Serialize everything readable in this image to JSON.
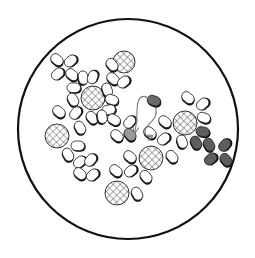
{
  "diagram": {
    "colors": {
      "background": "#ffffff",
      "outline": "#111111",
      "cell_fill": "#ffffff",
      "cell_shadow": "#111111",
      "donor_fill": "#6a6a6a",
      "recipient_fill": "#9a9a9a",
      "transformed_fill": "#5e5e5e",
      "hatch": "#444444",
      "arrow": "#777777"
    },
    "boundary": {
      "cx": 128,
      "cy": 129,
      "r": 110
    },
    "spheres": [
      {
        "x": 124,
        "y": 62,
        "r": 11
      },
      {
        "x": 93,
        "y": 98,
        "r": 12
      },
      {
        "x": 57,
        "y": 136,
        "r": 12
      },
      {
        "x": 185,
        "y": 123,
        "r": 12
      },
      {
        "x": 151,
        "y": 158,
        "r": 12
      },
      {
        "x": 117,
        "y": 193,
        "r": 12
      }
    ],
    "cells": [
      {
        "x": 57,
        "y": 60,
        "a": 40,
        "t": "plain"
      },
      {
        "x": 71,
        "y": 61,
        "a": -40,
        "t": "plain"
      },
      {
        "x": 58,
        "y": 74,
        "a": -40,
        "t": "plain"
      },
      {
        "x": 72,
        "y": 75,
        "a": 40,
        "t": "plain"
      },
      {
        "x": 83,
        "y": 78,
        "a": 80,
        "t": "plain"
      },
      {
        "x": 93,
        "y": 77,
        "a": -70,
        "t": "plain"
      },
      {
        "x": 74,
        "y": 88,
        "a": 0,
        "t": "plain"
      },
      {
        "x": 112,
        "y": 65,
        "a": 50,
        "t": "plain"
      },
      {
        "x": 113,
        "y": 79,
        "a": 40,
        "t": "plain"
      },
      {
        "x": 124,
        "y": 82,
        "a": -40,
        "t": "plain"
      },
      {
        "x": 107,
        "y": 90,
        "a": 70,
        "t": "plain"
      },
      {
        "x": 112,
        "y": 100,
        "a": 20,
        "t": "plain"
      },
      {
        "x": 109,
        "y": 110,
        "a": -10,
        "t": "plain"
      },
      {
        "x": 73,
        "y": 100,
        "a": 60,
        "t": "plain"
      },
      {
        "x": 59,
        "y": 112,
        "a": 40,
        "t": "plain"
      },
      {
        "x": 76,
        "y": 113,
        "a": -50,
        "t": "plain"
      },
      {
        "x": 92,
        "y": 118,
        "a": 50,
        "t": "plain"
      },
      {
        "x": 80,
        "y": 128,
        "a": 60,
        "t": "plain"
      },
      {
        "x": 102,
        "y": 117,
        "a": 80,
        "t": "plain"
      },
      {
        "x": 114,
        "y": 120,
        "a": 30,
        "t": "plain"
      },
      {
        "x": 130,
        "y": 122,
        "a": -50,
        "t": "plain"
      },
      {
        "x": 117,
        "y": 136,
        "a": 40,
        "t": "plain"
      },
      {
        "x": 78,
        "y": 146,
        "a": 0,
        "t": "plain"
      },
      {
        "x": 68,
        "y": 155,
        "a": 60,
        "t": "plain"
      },
      {
        "x": 80,
        "y": 162,
        "a": -40,
        "t": "plain"
      },
      {
        "x": 91,
        "y": 160,
        "a": -50,
        "t": "plain"
      },
      {
        "x": 80,
        "y": 174,
        "a": 40,
        "t": "plain"
      },
      {
        "x": 93,
        "y": 175,
        "a": -40,
        "t": "plain"
      },
      {
        "x": 188,
        "y": 98,
        "a": 40,
        "t": "plain"
      },
      {
        "x": 203,
        "y": 104,
        "a": -40,
        "t": "plain"
      },
      {
        "x": 204,
        "y": 118,
        "a": 20,
        "t": "plain"
      },
      {
        "x": 165,
        "y": 122,
        "a": 40,
        "t": "plain"
      },
      {
        "x": 150,
        "y": 133,
        "a": 40,
        "t": "plain"
      },
      {
        "x": 164,
        "y": 139,
        "a": -40,
        "t": "plain"
      },
      {
        "x": 172,
        "y": 157,
        "a": 50,
        "t": "plain"
      },
      {
        "x": 182,
        "y": 142,
        "a": 70,
        "t": "plain"
      },
      {
        "x": 130,
        "y": 157,
        "a": 40,
        "t": "plain"
      },
      {
        "x": 116,
        "y": 171,
        "a": 40,
        "t": "plain"
      },
      {
        "x": 131,
        "y": 171,
        "a": -40,
        "t": "plain"
      },
      {
        "x": 146,
        "y": 177,
        "a": 50,
        "t": "plain"
      },
      {
        "x": 137,
        "y": 194,
        "a": 60,
        "t": "plain"
      },
      {
        "x": 154,
        "y": 101,
        "a": 20,
        "t": "donor"
      },
      {
        "x": 130,
        "y": 135,
        "a": 50,
        "t": "recipient"
      },
      {
        "x": 203,
        "y": 132,
        "a": 10,
        "t": "transformed"
      },
      {
        "x": 196,
        "y": 143,
        "a": 60,
        "t": "transformed"
      },
      {
        "x": 209,
        "y": 145,
        "a": 60,
        "t": "transformed"
      },
      {
        "x": 225,
        "y": 145,
        "a": -50,
        "t": "transformed"
      },
      {
        "x": 211,
        "y": 159,
        "a": -40,
        "t": "transformed"
      },
      {
        "x": 226,
        "y": 160,
        "a": 50,
        "t": "transformed"
      }
    ],
    "arrows": [
      {
        "path": "M150 99 C140 92 137 100 137 112 C137 120 136 126 135 132",
        "head": [
          135,
          132
        ]
      },
      {
        "path": "M156 108 C158 118 150 122 146 128 C143 134 147 138 152 136",
        "head": [
          152,
          136
        ]
      }
    ]
  }
}
